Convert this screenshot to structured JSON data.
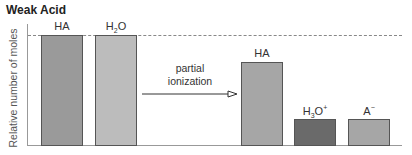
{
  "chart_data": {
    "type": "bar",
    "title": "Weak Acid",
    "xlabel": "",
    "ylabel": "Relative number of moles",
    "ylim": [
      0,
      1
    ],
    "grid": false,
    "reference_line": {
      "y": 1.0,
      "style": "dashed"
    },
    "groups": [
      {
        "name": "before",
        "categories": [
          "HA",
          "H2O"
        ],
        "values": [
          1.0,
          1.0
        ],
        "colors": [
          "#9a9a9a",
          "#bcbcbc"
        ]
      },
      {
        "name": "after",
        "categories": [
          "HA",
          "H3O+",
          "A-"
        ],
        "values": [
          0.75,
          0.24,
          0.24
        ],
        "colors": [
          "#a6a6a6",
          "#6a6a6a",
          "#a6a6a6"
        ]
      }
    ],
    "annotations": [
      {
        "text": "partial ionization",
        "type": "arrow",
        "from": "before",
        "to": "after"
      }
    ]
  },
  "title": "Weak Acid",
  "ylabel": "Relative number of moles",
  "arrow": {
    "line1": "partial",
    "line2": "ionization"
  },
  "bars": [
    {
      "label_main": "HA",
      "label_sub": "",
      "label_after": "",
      "label_sup": "",
      "value": 1.0,
      "color": "#9a9a9a",
      "x": 41
    },
    {
      "label_main": "H",
      "label_sub": "2",
      "label_after": "O",
      "label_sup": "",
      "value": 1.0,
      "color": "#bcbcbc",
      "x": 95
    },
    {
      "label_main": "HA",
      "label_sub": "",
      "label_after": "",
      "label_sup": "",
      "value": 0.75,
      "color": "#a6a6a6",
      "x": 241
    },
    {
      "label_main": "H",
      "label_sub": "3",
      "label_after": "O",
      "label_sup": "+",
      "value": 0.24,
      "color": "#6a6a6a",
      "x": 294
    },
    {
      "label_main": "A",
      "label_sub": "",
      "label_after": "",
      "label_sup": "−",
      "value": 0.24,
      "color": "#a6a6a6",
      "x": 348
    }
  ]
}
